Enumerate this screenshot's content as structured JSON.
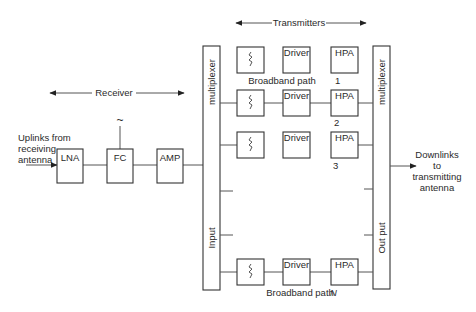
{
  "receiver": {
    "label": "Receiver",
    "input_label_lines": [
      "Uplinks from",
      "receiving",
      "antenna"
    ],
    "blocks": [
      {
        "id": "lna",
        "label": "LNA"
      },
      {
        "id": "fc",
        "label": "FC"
      },
      {
        "id": "amp",
        "label": "AMP"
      }
    ],
    "oscillator_symbol": "~"
  },
  "transmitters": {
    "label": "Transmitters",
    "paths": [
      {
        "index": "1",
        "filter_symbol": "filter",
        "driver": "Driver",
        "hpa": "HPA",
        "caption": "Broadband path"
      },
      {
        "index": "2",
        "filter_symbol": "filter",
        "driver": "Driver",
        "hpa": "HPA"
      },
      {
        "index": "3",
        "filter_symbol": "filter",
        "driver": "Driver",
        "hpa": "HPA"
      },
      {
        "index": "N",
        "filter_symbol": "filter",
        "driver": "Driver",
        "hpa": "HPA",
        "caption": "Broadband path"
      }
    ]
  },
  "input_multiplexer": {
    "top_label": "multiplexer",
    "bottom_label": "Input"
  },
  "output_multiplexer": {
    "top_label": "multiplexer",
    "bottom_label": "Out put"
  },
  "output_label_lines": [
    "Downlinks",
    "to",
    "transmitting",
    "antenna"
  ]
}
